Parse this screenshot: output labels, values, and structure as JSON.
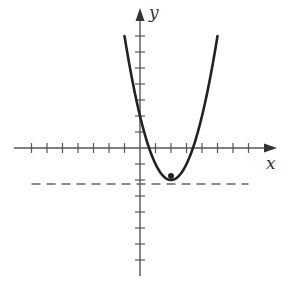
{
  "chart_data": {
    "type": "line",
    "title": "",
    "xlabel": "x",
    "ylabel": "y",
    "xlim": [
      -7,
      8
    ],
    "ylim": [
      -8,
      8.5
    ],
    "grid": false,
    "legend": null,
    "x_ticks": [
      -7,
      -6,
      -5,
      -4,
      -3,
      -2,
      -1,
      1,
      2,
      3,
      4,
      5,
      6,
      7
    ],
    "y_ticks": [
      -7,
      -6,
      -5,
      -4,
      -3,
      -2,
      -1,
      1,
      2,
      3,
      4,
      5,
      6,
      7
    ],
    "tick_labels_shown": false,
    "series": [
      {
        "name": "parabola",
        "equation": "y = (x - 2)^2 - 2",
        "style": "solid",
        "color": "#222222",
        "x": [
          -1,
          -0.5,
          0,
          0.5,
          1,
          1.5,
          2,
          2.5,
          3,
          3.5,
          4,
          4.5,
          5
        ],
        "y": [
          7,
          4.25,
          2,
          0.25,
          -1,
          -1.75,
          -2,
          -1.75,
          -1,
          0.25,
          2,
          4.25,
          7
        ]
      },
      {
        "name": "directrix",
        "equation": "y = -2.25",
        "style": "dashed",
        "color": "#555555",
        "x": [
          -7,
          7
        ],
        "y": [
          -2.25,
          -2.25
        ]
      }
    ],
    "points": [
      {
        "name": "focus",
        "x": 2,
        "y": -1.75
      }
    ],
    "vertex": {
      "x": 2,
      "y": -2
    }
  },
  "labels": {
    "x_axis": "x",
    "y_axis": "y"
  },
  "layout": {
    "origin_px": [
      140,
      148
    ],
    "unit_x_px": 15.5,
    "unit_y_px": 16
  },
  "colors": {
    "axis": "#555555",
    "curve": "#222222",
    "dashed": "#666666"
  }
}
